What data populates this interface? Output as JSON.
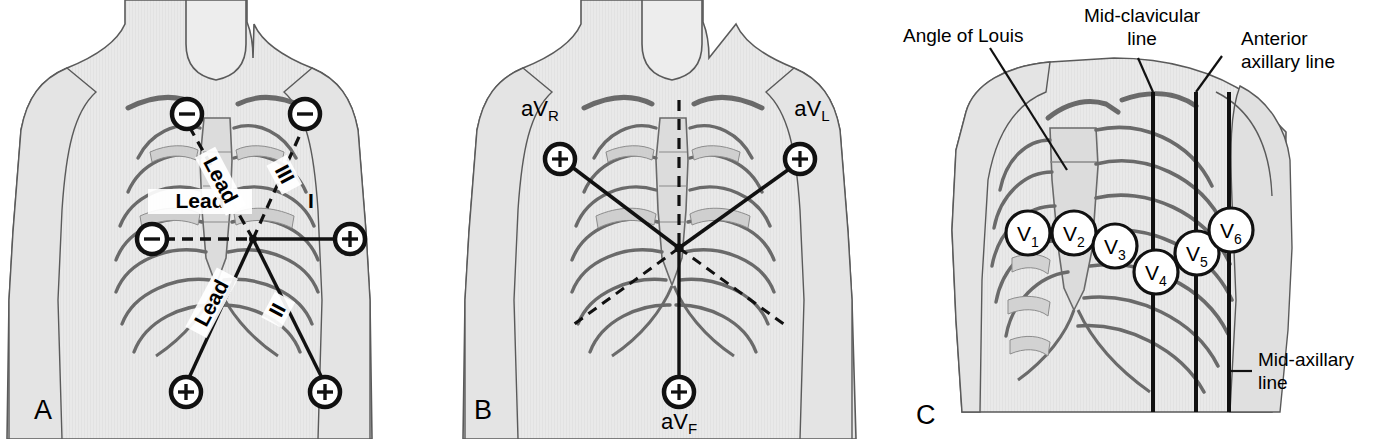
{
  "figure": {
    "panels": [
      {
        "letter": "A",
        "name": "limb-leads-einthoven-triangle",
        "labels": {
          "lead1_word": "Lead",
          "lead1_numeral": "I",
          "lead2_word": "Lead",
          "lead2_numeral": "II",
          "lead3_word": "Lead",
          "lead3_numeral": "III"
        },
        "electrodes": [
          {
            "id": "RA",
            "polarity": "−",
            "x": 187,
            "y": 114
          },
          {
            "id": "LA",
            "polarity": "−",
            "x": 305,
            "y": 114
          },
          {
            "id": "RA-lateral",
            "polarity": "−",
            "x": 152,
            "y": 239
          },
          {
            "id": "LA-lateral",
            "polarity": "+",
            "x": 350,
            "y": 239
          },
          {
            "id": "RL",
            "polarity": "+",
            "x": 186,
            "y": 392
          },
          {
            "id": "LL",
            "polarity": "+",
            "x": 325,
            "y": 392
          }
        ]
      },
      {
        "letter": "B",
        "name": "augmented-limb-leads",
        "labels": {
          "avr_base": "aV",
          "avr_sub": "R",
          "avl_base": "aV",
          "avl_sub": "L",
          "avf_base": "aV",
          "avf_sub": "F"
        },
        "electrodes": [
          {
            "id": "aVR",
            "polarity": "+",
            "x": 560,
            "y": 159
          },
          {
            "id": "aVL",
            "polarity": "+",
            "x": 800,
            "y": 159
          },
          {
            "id": "aVF",
            "polarity": "+",
            "x": 679,
            "y": 392
          }
        ]
      },
      {
        "letter": "C",
        "name": "precordial-chest-leads",
        "callouts": [
          {
            "id": "angle-of-louis",
            "text": "Angle of Louis"
          },
          {
            "id": "mid-clavicular-line",
            "line1": "Mid-clavicular",
            "line2": "line"
          },
          {
            "id": "anterior-axillary-line",
            "line1": "Anterior",
            "line2": "axillary line"
          },
          {
            "id": "mid-axillary-line",
            "line1": "Mid-axillary",
            "line2": "line"
          }
        ],
        "chest_leads": [
          {
            "base": "V",
            "sub": "1",
            "x": 1028,
            "y": 233
          },
          {
            "base": "V",
            "sub": "2",
            "x": 1074,
            "y": 233
          },
          {
            "base": "V",
            "sub": "3",
            "x": 1115,
            "y": 246
          },
          {
            "base": "V",
            "sub": "4",
            "x": 1156,
            "y": 272
          },
          {
            "base": "V",
            "sub": "5",
            "x": 1197,
            "y": 253
          },
          {
            "base": "V",
            "sub": "6",
            "x": 1231,
            "y": 230
          }
        ]
      }
    ],
    "colors": {
      "skin_fill": "#e9e9e9",
      "bone_fill": "#d6d6d6",
      "outline": "#5a5a5a",
      "ink": "#111111",
      "white": "#ffffff"
    }
  }
}
